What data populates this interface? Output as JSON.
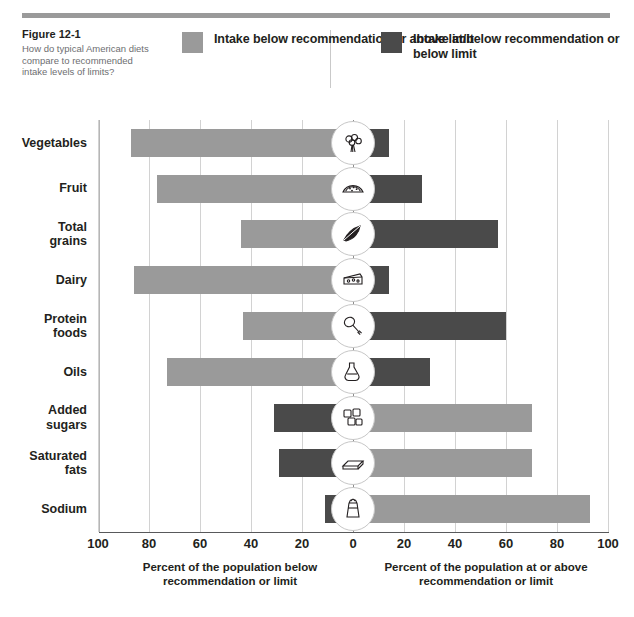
{
  "figure": {
    "number": "Figure 12-1",
    "question": "How do typical American diets compare to recommended intake levels of limits?"
  },
  "legend": {
    "left": {
      "label": "Intake below recommendation or above limit",
      "color": "#9a9a9a",
      "swatch_name": "legend-swatch-light"
    },
    "right": {
      "label": "Intake at/below recommendation or below limit",
      "color": "#4a4a4a",
      "swatch_name": "legend-swatch-dark"
    }
  },
  "colors": {
    "light_gray": "#9a9a9a",
    "dark_gray": "#4a4a4a",
    "gridline": "#d2d2d2",
    "zero_line": "#8d8d8d",
    "axis": "#58595b",
    "text": "#231f20",
    "subtext": "#6d6e71"
  },
  "chart_data": {
    "type": "bar",
    "orientation": "horizontal-diverging",
    "title": "How do typical American diets compare to recommended intake levels of limits?",
    "xlabel_left": "Percent of the population below recommendation or limit",
    "xlabel_right": "Percent of the population at or above recommendation or limit",
    "ylabel": "",
    "grid": true,
    "legend_position": "top",
    "xlim": [
      -100,
      100
    ],
    "xticks": [
      -100,
      -80,
      -60,
      -40,
      -20,
      0,
      20,
      40,
      60,
      80,
      100
    ],
    "xtick_labels": [
      "100",
      "80",
      "60",
      "40",
      "20",
      "0",
      "20",
      "40",
      "60",
      "80",
      "100"
    ],
    "categories": [
      "Vegetables",
      "Fruit",
      "Total grains",
      "Dairy",
      "Protein foods",
      "Oils",
      "Added sugars",
      "Saturated fats",
      "Sodium"
    ],
    "series": [
      {
        "name": "Intake below recommendation or above limit",
        "color": "#9a9a9a",
        "values": [
          87,
          77,
          44,
          86,
          43,
          73,
          70,
          70,
          93
        ],
        "side": [
          "left",
          "left",
          "left",
          "left",
          "left",
          "left",
          "right",
          "right",
          "right"
        ]
      },
      {
        "name": "Intake at/below recommendation or below limit",
        "color": "#4a4a4a",
        "values": [
          14,
          27,
          57,
          14,
          60,
          30,
          31,
          29,
          11
        ],
        "side": [
          "right",
          "right",
          "right",
          "right",
          "right",
          "right",
          "left",
          "left",
          "left"
        ]
      }
    ],
    "rows": [
      {
        "category": "Vegetables",
        "icon": "broccoli-icon",
        "light": {
          "side": "left",
          "value": 87
        },
        "dark": {
          "side": "right",
          "value": 14
        }
      },
      {
        "category": "Fruit",
        "icon": "watermelon-icon",
        "light": {
          "side": "left",
          "value": 77
        },
        "dark": {
          "side": "right",
          "value": 27
        }
      },
      {
        "category": "Total grains",
        "icon": "grain-icon",
        "light": {
          "side": "left",
          "value": 44
        },
        "dark": {
          "side": "right",
          "value": 57
        }
      },
      {
        "category": "Dairy",
        "icon": "cheese-icon",
        "light": {
          "side": "left",
          "value": 86
        },
        "dark": {
          "side": "right",
          "value": 14
        }
      },
      {
        "category": "Protein foods",
        "icon": "drumstick-icon",
        "light": {
          "side": "left",
          "value": 43
        },
        "dark": {
          "side": "right",
          "value": 60
        }
      },
      {
        "category": "Oils",
        "icon": "oil-bottle-icon",
        "light": {
          "side": "left",
          "value": 73
        },
        "dark": {
          "side": "right",
          "value": 30
        }
      },
      {
        "category": "Added sugars",
        "icon": "sugar-cubes-icon",
        "light": {
          "side": "right",
          "value": 70
        },
        "dark": {
          "side": "left",
          "value": 31
        }
      },
      {
        "category": "Saturated fats",
        "icon": "butter-icon",
        "light": {
          "side": "right",
          "value": 70
        },
        "dark": {
          "side": "left",
          "value": 29
        }
      },
      {
        "category": "Sodium",
        "icon": "salt-shaker-icon",
        "light": {
          "side": "right",
          "value": 93
        },
        "dark": {
          "side": "left",
          "value": 11
        }
      }
    ]
  }
}
